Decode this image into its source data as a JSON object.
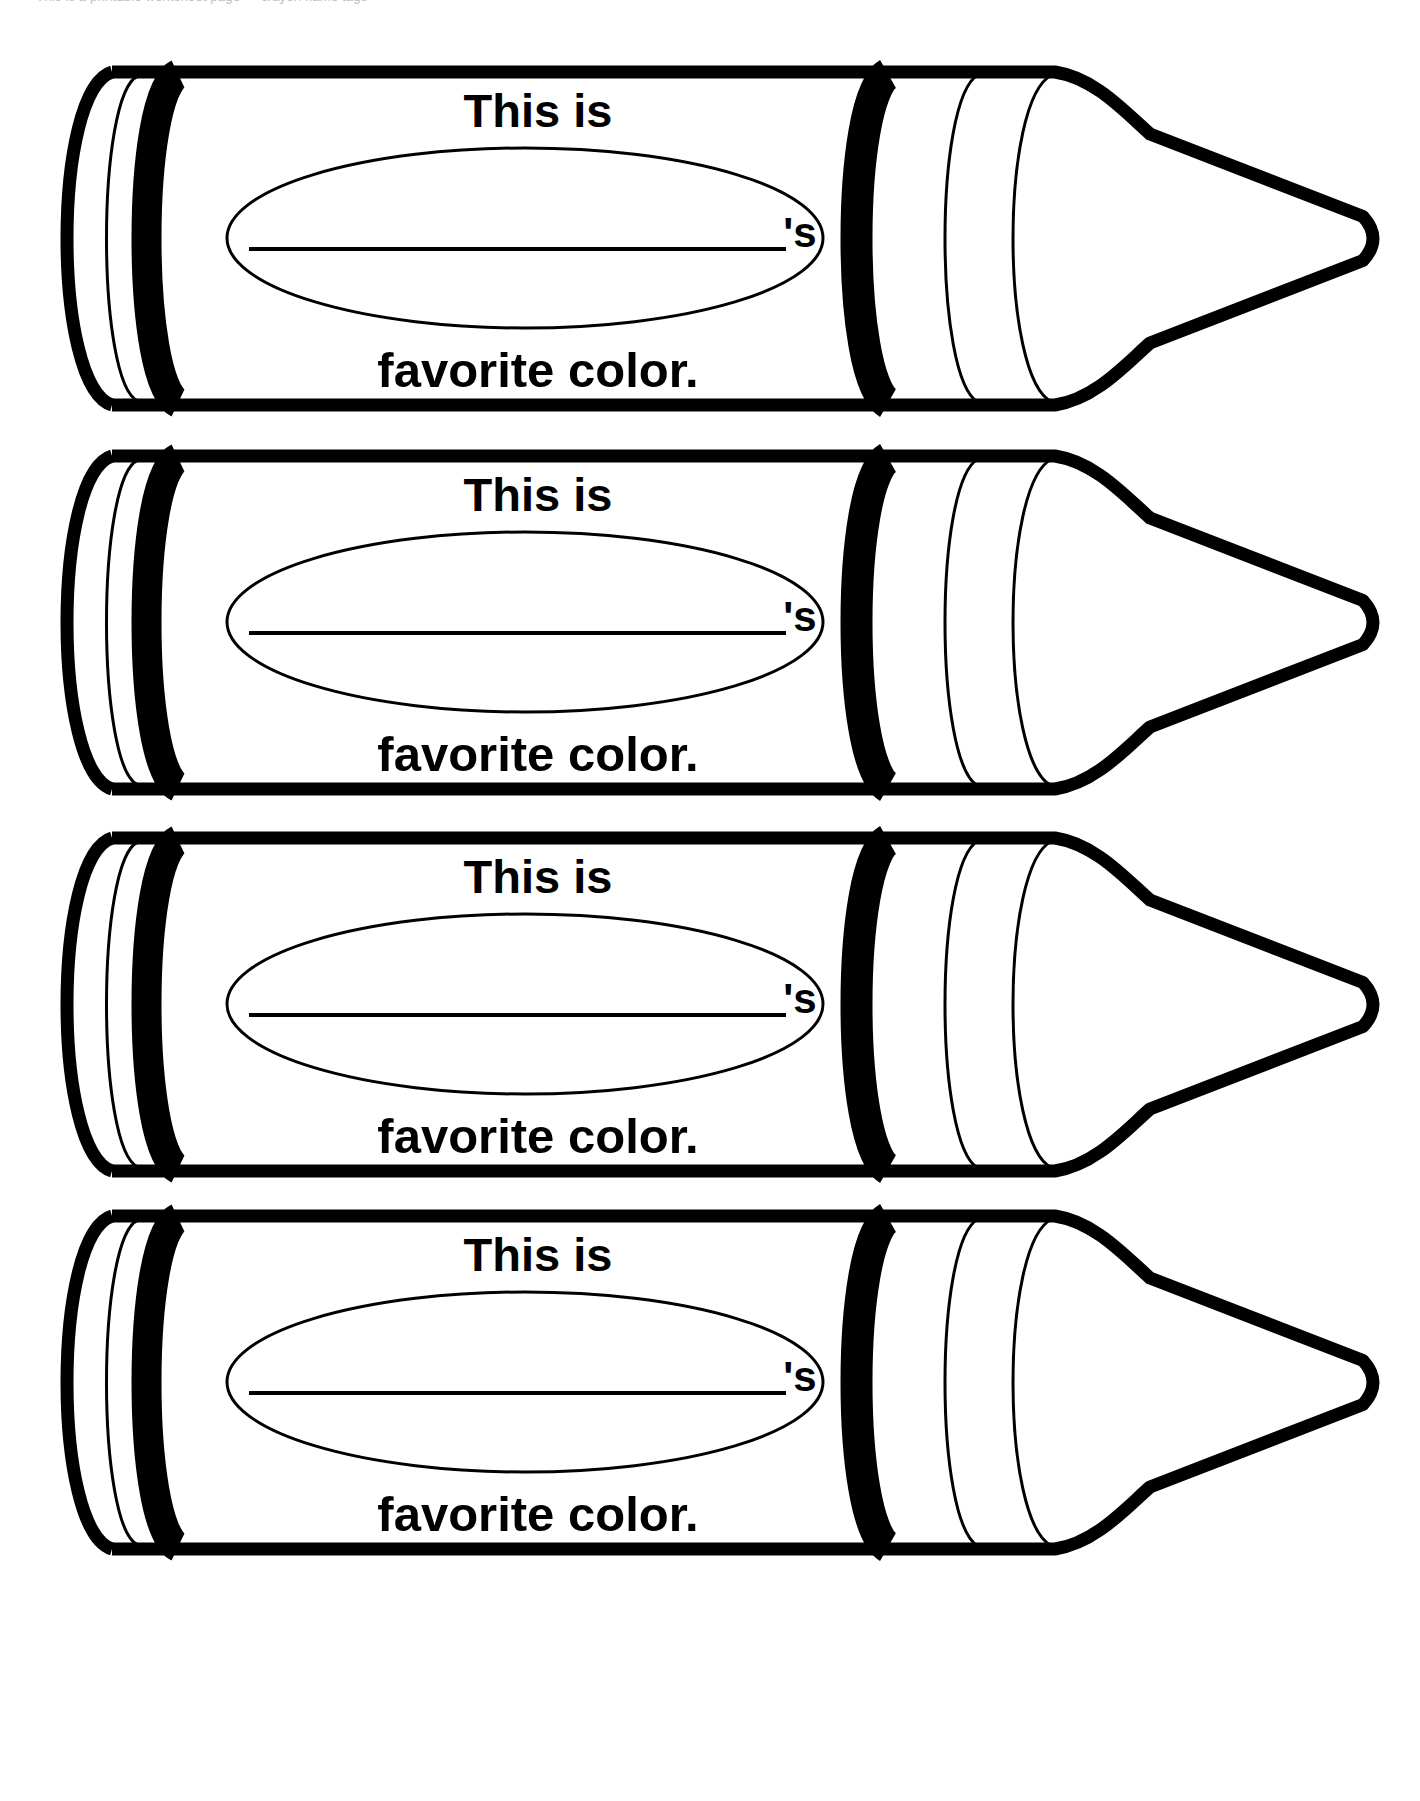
{
  "page": {
    "background_color": "#ffffff",
    "ink_color": "#000000",
    "width": 1420,
    "height": 1801,
    "clipped_header_text": "This is a printable worksheet page — crayon name tags"
  },
  "worksheet": {
    "item_count": 4,
    "item_name": "crayon-name-tag",
    "line_1": "This is",
    "possessive": "'s",
    "line_2": "favorite color.",
    "write_line_label": "name-write-line"
  },
  "crayons": [
    {
      "index": 1,
      "line_1": "This is",
      "possessive": "'s",
      "line_2": "favorite color.",
      "top": 52
    },
    {
      "index": 2,
      "line_1": "This is",
      "possessive": "'s",
      "line_2": "favorite color.",
      "top": 436
    },
    {
      "index": 3,
      "line_1": "This is",
      "possessive": "'s",
      "line_2": "favorite color.",
      "top": 818
    },
    {
      "index": 4,
      "line_1": "This is",
      "possessive": "'s",
      "line_2": "favorite color.",
      "top": 1196
    }
  ]
}
